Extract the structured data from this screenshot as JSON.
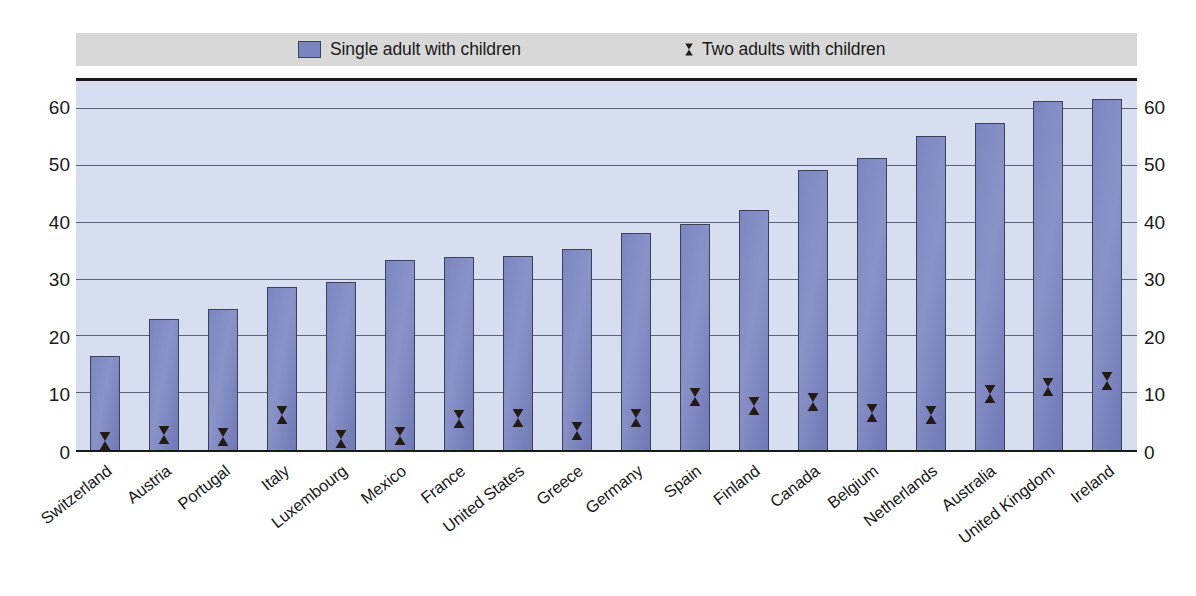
{
  "legend": {
    "entries": [
      {
        "icon": "square-swatch-icon",
        "label": "Single adult with children",
        "color": "#7a85c0"
      },
      {
        "icon": "diamond-marker-icon",
        "label": "Two adults with children",
        "color": "#231b16"
      }
    ],
    "background": "#d8d8d8"
  },
  "axes": {
    "y_ticks": [
      "60",
      "50",
      "40",
      "30",
      "20",
      "10",
      "0"
    ],
    "y_ticks_right": [
      "60",
      "50",
      "40",
      "30",
      "20",
      "10",
      "0"
    ]
  },
  "style": {
    "plot_background": "#d7deef",
    "bar_fill": "#7a85c0",
    "bar_border": "#3b4257",
    "gridline": "#5a6075",
    "marker_fill": "#231b16",
    "axis_text": "#1a1a1a"
  },
  "chart_data": {
    "type": "bar",
    "title": "",
    "subtitle": "",
    "xlabel": "",
    "ylabel": "",
    "ylim": [
      0,
      65
    ],
    "grid": true,
    "legend_position": "top",
    "categories": [
      "Switzerland",
      "Austria",
      "Portugal",
      "Italy",
      "Luxembourg",
      "Mexico",
      "France",
      "United States",
      "Greece",
      "Germany",
      "Spain",
      "Finland",
      "Canada",
      "Belgium",
      "Netherlands",
      "Australia",
      "United Kingdom",
      "Ireland"
    ],
    "series": [
      {
        "name": "Single adult with children",
        "type": "bar",
        "values": [
          16.6,
          23.1,
          24.9,
          28.8,
          29.6,
          33.4,
          34.0,
          34.2,
          35.4,
          38.2,
          39.8,
          42.2,
          49.4,
          51.5,
          55.4,
          57.6,
          61.4,
          61.8
        ]
      },
      {
        "name": "Two adults with children",
        "type": "scatter",
        "marker": "diamond",
        "values": [
          1.5,
          2.6,
          2.2,
          6.1,
          1.9,
          2.5,
          5.4,
          5.5,
          3.3,
          5.5,
          9.2,
          7.6,
          8.4,
          6.5,
          6.1,
          9.8,
          11.0,
          12.0
        ]
      }
    ]
  }
}
